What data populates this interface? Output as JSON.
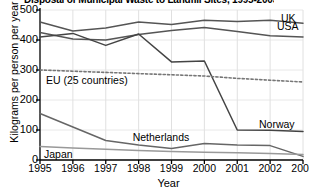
{
  "chart_data": {
    "type": "line",
    "title": "Disposal of Municipal Waste to Landfill Sites, 1995-2003",
    "xlabel": "Year",
    "ylabel": "Kilograms per person per year",
    "x": [
      1995,
      1996,
      1997,
      1998,
      1999,
      2000,
      2001,
      2002,
      2003
    ],
    "xtick_labels": [
      "1995",
      "1996",
      "1997",
      "1998",
      "1999",
      "2000",
      "2001",
      "2002",
      "2003"
    ],
    "ytick_labels": [
      "0",
      "100",
      "200",
      "300",
      "400",
      "500"
    ],
    "ytick_values": [
      0,
      100,
      200,
      300,
      400,
      500
    ],
    "ylim": [
      0,
      500
    ],
    "xlim": [
      1995,
      2003
    ],
    "grid": true,
    "legend_position": "inline-labels",
    "series": [
      {
        "name": "UK",
        "label": "UK",
        "style": "solid",
        "color": "#555555",
        "values": [
          460,
          430,
          440,
          460,
          452,
          466,
          462,
          466,
          456
        ]
      },
      {
        "name": "USA",
        "label": "USA",
        "style": "solid",
        "color": "#555555",
        "values": [
          425,
          403,
          400,
          418,
          432,
          442,
          428,
          414,
          410
        ]
      },
      {
        "name": "Norway",
        "label": "Norway",
        "style": "solid",
        "color": "#444444",
        "values": [
          410,
          422,
          382,
          420,
          327,
          330,
          100,
          99,
          95
        ]
      },
      {
        "name": "EU (25 countries)",
        "label": "EU (25 countries)",
        "style": "dotted",
        "color": "#777777",
        "values": [
          300,
          296,
          292,
          288,
          284,
          280,
          272,
          266,
          260
        ]
      },
      {
        "name": "Netherlands",
        "label": "Netherlands",
        "style": "solid",
        "color": "#666666",
        "values": [
          155,
          110,
          65,
          50,
          38,
          55,
          50,
          48,
          12
        ]
      },
      {
        "name": "Japan",
        "label": "Japan",
        "style": "solid",
        "color": "#999999",
        "values": [
          45,
          40,
          36,
          32,
          28,
          26,
          24,
          22,
          18
        ]
      }
    ]
  }
}
